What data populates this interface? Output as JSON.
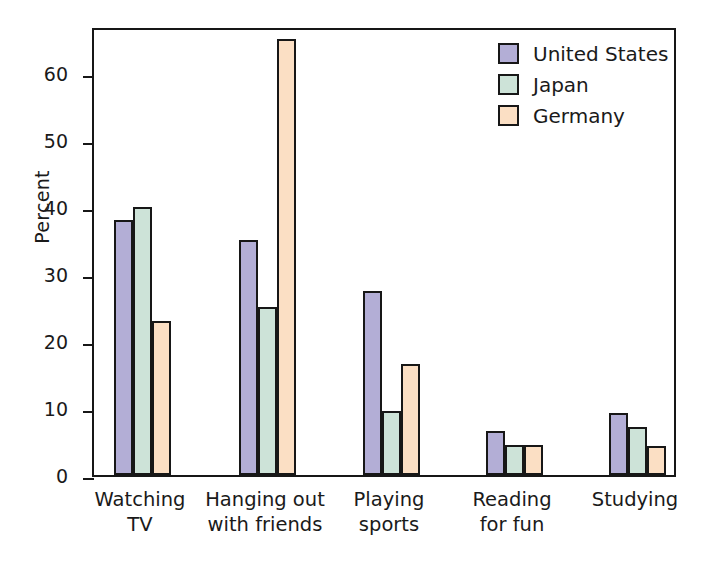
{
  "chart_data": {
    "type": "bar",
    "title": "",
    "xlabel": "",
    "ylabel": "Percent",
    "ylim": [
      0,
      67
    ],
    "yticks": [
      0,
      10,
      20,
      30,
      40,
      50,
      60
    ],
    "ytick_labels": [
      "0",
      "10",
      "20",
      "30",
      "40",
      "50",
      "60"
    ],
    "grid": false,
    "legend_position": "top-right",
    "categories": [
      "Watching TV",
      "Hanging out with friends",
      "Playing sports",
      "Reading for fun",
      "Studying"
    ],
    "category_lines": [
      [
        "Watching",
        "TV"
      ],
      [
        "Hanging out",
        "with friends"
      ],
      [
        "Playing",
        "sports"
      ],
      [
        "Reading",
        "for fun"
      ],
      [
        "Studying",
        ""
      ]
    ],
    "series": [
      {
        "name": "United States",
        "color": "#b3aed6",
        "values": [
          38,
          35,
          27.5,
          6.5,
          9.3
        ]
      },
      {
        "name": "Japan",
        "color": "#cde3d8",
        "values": [
          40,
          25,
          9.6,
          4.5,
          7.2
        ]
      },
      {
        "name": "Germany",
        "color": "#fbdfc4",
        "values": [
          23,
          65,
          16.5,
          4.5,
          4.3
        ]
      }
    ]
  },
  "legend": {
    "entries": [
      {
        "label": "United States",
        "color": "#b3aed6"
      },
      {
        "label": "Japan",
        "color": "#cde3d8"
      },
      {
        "label": "Germany",
        "color": "#fbdfc4"
      }
    ]
  },
  "axis": {
    "y_title": "Percent"
  },
  "style": {
    "outline_color": "#171717",
    "background": "#ffffff"
  }
}
